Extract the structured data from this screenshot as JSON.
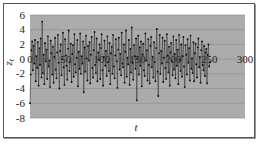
{
  "chart_data": {
    "type": "line",
    "title": "",
    "xlabel": "t",
    "ylabel": "z_t",
    "xlim": [
      0,
      300
    ],
    "ylim": [
      -8,
      6
    ],
    "x_ticks": [
      0,
      50,
      100,
      150,
      200,
      250,
      300
    ],
    "y_ticks": [
      6,
      4,
      2,
      0,
      -2,
      -4,
      -6,
      -8
    ],
    "grid": {
      "horizontal": true,
      "vertical": false
    },
    "legend": null,
    "markers": true,
    "series": [
      {
        "name": "z_t",
        "x_start": 0,
        "x_step": 1,
        "values": [
          -6.0,
          -2.1,
          1.2,
          2.4,
          -1.5,
          1.8,
          -0.6,
          2.6,
          -3.0,
          0.4,
          -1.2,
          2.3,
          -3.6,
          1.5,
          -0.8,
          2.8,
          -2.5,
          5.1,
          -1.9,
          0.6,
          -3.4,
          2.2,
          -0.3,
          1.3,
          -2.7,
          3.1,
          -1.0,
          -0.2,
          -3.8,
          2.5,
          0.8,
          -2.1,
          1.7,
          -3.2,
          0.3,
          2.9,
          -1.4,
          -2.6,
          0.9,
          3.3,
          -0.5,
          -4.0,
          1.1,
          2.0,
          -2.2,
          0.0,
          3.6,
          -1.1,
          -3.5,
          2.7,
          0.5,
          -0.9,
          -2.8,
          1.4,
          3.9,
          -1.6,
          -0.4,
          2.1,
          -3.1,
          0.7,
          1.9,
          -2.4,
          3.4,
          -0.7,
          -1.8,
          0.2,
          2.6,
          -3.7,
          1.0,
          -1.3,
          3.5,
          -2.0,
          0.4,
          -0.6,
          2.4,
          -4.5,
          1.6,
          -1.7,
          3.2,
          0.1,
          -2.9,
          1.8,
          -0.2,
          2.3,
          -3.3,
          0.6,
          3.0,
          -1.2,
          -2.5,
          1.2,
          3.7,
          -0.8,
          -1.9,
          2.8,
          -3.0,
          0.9,
          -0.1,
          2.0,
          -2.7,
          1.5,
          3.4,
          -1.5,
          -3.6,
          0.3,
          2.5,
          -0.9,
          1.1,
          -2.3,
          3.1,
          -0.4,
          -1.6,
          2.2,
          -3.4,
          0.8,
          1.7,
          -2.0,
          3.3,
          -1.0,
          -2.6,
          0.5,
          2.7,
          -0.3,
          -3.9,
          1.3,
          2.9,
          -1.4,
          0.7,
          -2.2,
          3.6,
          -0.6,
          -1.1,
          2.0,
          -3.2,
          1.0,
          3.9,
          -2.4,
          0.2,
          -0.7,
          2.6,
          -3.5,
          1.4,
          -1.8,
          4.3,
          -0.5,
          -2.8,
          1.9,
          0.4,
          -1.3,
          2.8,
          -5.6,
          0.1,
          3.2,
          -2.1,
          1.6,
          -0.9,
          2.4,
          -3.7,
          0.6,
          2.1,
          -1.5,
          -2.3,
          3.5,
          -0.2,
          1.2,
          -2.9,
          2.7,
          -0.8,
          -3.3,
          1.8,
          3.0,
          -1.1,
          0.3,
          -2.5,
          2.3,
          -0.4,
          -3.0,
          1.5,
          4.1,
          -1.7,
          -5.0,
          0.8,
          3.3,
          -2.0,
          1.1,
          -0.6,
          2.9,
          -3.1,
          0.2,
          2.5,
          -1.2,
          -2.7,
          3.4,
          0.5,
          -1.8,
          1.7,
          -3.6,
          0.9,
          2.2,
          -0.3,
          -2.2,
          3.1,
          -1.4,
          0.7,
          -2.6,
          2.6,
          -0.9,
          1.3,
          -3.4,
          3.3,
          -0.1,
          -1.6,
          2.0,
          -2.4,
          0.4,
          3.0,
          -1.0,
          -3.8,
          1.9,
          0.6,
          -2.1,
          2.7,
          -0.5,
          1.5,
          -2.9,
          3.2,
          -1.3,
          0.1,
          -1.9,
          2.3,
          -3.0,
          0.8,
          2.1,
          -0.7,
          -2.5,
          1.6,
          2.8,
          -1.1,
          0.3,
          -3.2,
          1.2,
          2.4,
          -0.8,
          -1.5,
          1.8,
          -2.3,
          0.9,
          1.4,
          -3.3,
          0.6,
          2.0,
          -1.0,
          -0.4
        ]
      }
    ]
  }
}
